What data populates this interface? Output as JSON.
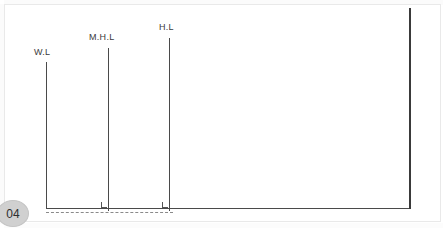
{
  "page": {
    "badge_number": "04",
    "background_color": "#ffffff",
    "frame_color": "#e9e9e9"
  },
  "drawing": {
    "title": "water level section diagram",
    "line_color": "#4a4a4a",
    "dash_color": "#8a8a8a",
    "levels": [
      {
        "id": "wl",
        "label": "W.L",
        "name": "water-level-line",
        "x": 46,
        "top": 62,
        "bottom": 209,
        "label_x": 34,
        "label_y": 47,
        "heavy": false,
        "corner_mark": false
      },
      {
        "id": "mhl",
        "label": "M.H.L",
        "name": "mean-high-level-line",
        "x": 108,
        "top": 48,
        "bottom": 211,
        "label_x": 89,
        "label_y": 32,
        "heavy": false,
        "corner_mark": true
      },
      {
        "id": "hl",
        "label": "H.L",
        "name": "high-level-line",
        "x": 169,
        "top": 38,
        "bottom": 211,
        "label_x": 159,
        "label_y": 22,
        "heavy": false,
        "corner_mark": true
      },
      {
        "id": "right",
        "label": "",
        "name": "right-boundary-line",
        "x": 409,
        "top": 8,
        "bottom": 209,
        "label_x": 0,
        "label_y": 0,
        "heavy": true,
        "corner_mark": false
      }
    ],
    "baseline": {
      "name": "ground-baseline",
      "x_start": 46,
      "x_end": 411,
      "y": 208
    },
    "dashed_bed": {
      "name": "dashed-bed-line",
      "x_start": 46,
      "x_end": 173,
      "y": 212
    }
  }
}
